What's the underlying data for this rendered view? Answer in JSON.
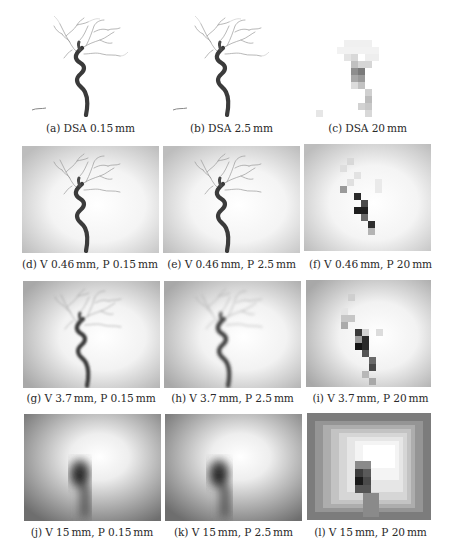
{
  "figure": {
    "rows": [
      {
        "row_label": "DSA",
        "panels": [
          {
            "id": "a",
            "caption": "(a) DSA 0.15 mm",
            "type": "dsa",
            "vessel_blur": 0,
            "bg_vignette": 0,
            "pixel": 0
          },
          {
            "id": "b",
            "caption": "(b) DSA 2.5 mm",
            "type": "dsa",
            "vessel_blur": 0.4,
            "bg_vignette": 0,
            "pixel": 0
          },
          {
            "id": "c",
            "caption": "(c) DSA 20 mm",
            "type": "dsa",
            "vessel_blur": 0,
            "bg_vignette": 0,
            "pixel": 7
          }
        ]
      },
      {
        "row_label": "V 0.46 mm",
        "panels": [
          {
            "id": "d",
            "caption": "(d) V 0.46 mm, P 0.15 mm",
            "type": "projection",
            "vessel_blur": 0.3,
            "bg_vignette": 0.35,
            "pixel": 0
          },
          {
            "id": "e",
            "caption": "(e) V 0.46 mm, P 2.5 mm",
            "type": "projection",
            "vessel_blur": 0.6,
            "bg_vignette": 0.35,
            "pixel": 0
          },
          {
            "id": "f",
            "caption": "(f) V 0.46 mm, P 20 mm",
            "type": "projection",
            "vessel_blur": 0,
            "bg_vignette": 0.35,
            "pixel": 7
          }
        ]
      },
      {
        "row_label": "V 3.7 mm",
        "panels": [
          {
            "id": "g",
            "caption": "(g) V 3.7 mm, P 0.15 mm",
            "type": "projection",
            "vessel_blur": 1.2,
            "bg_vignette": 0.5,
            "pixel": 0
          },
          {
            "id": "h",
            "caption": "(h) V 3.7 mm, P 2.5 mm",
            "type": "projection",
            "vessel_blur": 1.4,
            "bg_vignette": 0.5,
            "pixel": 0
          },
          {
            "id": "i",
            "caption": "(i) V 3.7 mm, P 20 mm",
            "type": "projection",
            "vessel_blur": 0,
            "bg_vignette": 0.5,
            "pixel": 7
          }
        ]
      },
      {
        "row_label": "V 15 mm",
        "panels": [
          {
            "id": "j",
            "caption": "(j) V 15 mm, P 0.15 mm",
            "type": "projection",
            "vessel_blur": 5,
            "bg_vignette": 0.75,
            "pixel": 0
          },
          {
            "id": "k",
            "caption": "(k) V 15 mm, P 2.5 mm",
            "type": "projection",
            "vessel_blur": 5,
            "bg_vignette": 0.75,
            "pixel": 0
          },
          {
            "id": "l",
            "caption": "(l) V 15 mm, P 20 mm",
            "type": "projection",
            "vessel_blur": 0,
            "bg_vignette": 0.75,
            "pixel": 8
          }
        ]
      }
    ]
  },
  "captions": {
    "a": "(a) DSA 0.15 mm",
    "b": "(b) DSA 2.5 mm",
    "c": "(c) DSA 20 mm",
    "d": "(d) V 0.46 mm, P 0.15 mm",
    "e": "(e) V 0.46 mm, P 2.5 mm",
    "f": "(f) V 0.46 mm, P 20 mm",
    "g": "(g) V 3.7 mm, P 0.15 mm",
    "h": "(h) V 3.7 mm, P 2.5 mm",
    "i": "(i) V 3.7 mm, P 20 mm",
    "j": "(j) V 15 mm, P 0.15 mm",
    "k": "(k) V 15 mm, P 2.5 mm",
    "l": "(l) V 15 mm, P 20 mm"
  }
}
